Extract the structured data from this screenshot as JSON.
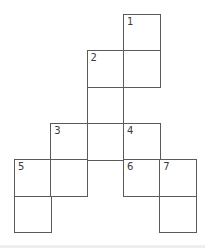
{
  "puzzle": {
    "type": "crossword-grid",
    "cell_size": 36,
    "origin_x": 14,
    "origin_y": 14,
    "line_color": "#5a5a5a",
    "cells": [
      {
        "row": 0,
        "col": 3,
        "number": "1"
      },
      {
        "row": 1,
        "col": 2,
        "number": "2"
      },
      {
        "row": 1,
        "col": 3,
        "number": ""
      },
      {
        "row": 2,
        "col": 2,
        "number": ""
      },
      {
        "row": 3,
        "col": 1,
        "number": "3"
      },
      {
        "row": 3,
        "col": 2,
        "number": ""
      },
      {
        "row": 3,
        "col": 3,
        "number": "4"
      },
      {
        "row": 4,
        "col": 0,
        "number": "5"
      },
      {
        "row": 4,
        "col": 1,
        "number": ""
      },
      {
        "row": 4,
        "col": 3,
        "number": "6"
      },
      {
        "row": 4,
        "col": 4,
        "number": "7"
      },
      {
        "row": 5,
        "col": 0,
        "number": ""
      },
      {
        "row": 5,
        "col": 4,
        "number": ""
      }
    ]
  }
}
